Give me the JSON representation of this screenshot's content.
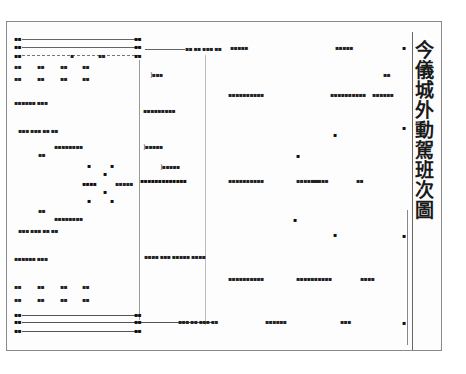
{
  "document": {
    "title": "今儀城外動駕班次圖",
    "title_chars": [
      "今",
      "儀",
      "城",
      "外",
      "動",
      "駕",
      "班",
      "次",
      "圖"
    ],
    "illegible_note": "Small annotations are rotated classical characters, illegible at this resolution"
  },
  "marks": {
    "left_top_rows": [
      {
        "left": "▪▪",
        "right": "▪▪"
      },
      {
        "left": "▪▪",
        "right": "▪▪"
      },
      {
        "left": "▪▪",
        "mid1": "▪",
        "mid2": "▪▪",
        "right": "▪▪"
      }
    ],
    "left_top_grid": [
      [
        "▪▪",
        "▪▪",
        "▪▪",
        "▪▪"
      ],
      [
        "▪▪",
        "▪▪",
        "▪▪",
        "▪▪"
      ]
    ],
    "left_groups": [
      "▪▪▪▪▪▪ ▪▪▪",
      "▪▪▪ ▪▪▪ ▪▪ ▪▪",
      "▪▪▪▪▪▪▪▪",
      "▪▪",
      "▪▪▪▪▪",
      "▪▪▪▪▪",
      "▪▪",
      "▪▪▪▪▪▪▪▪",
      "▪▪▪ ▪▪▪ ▪▪ ▪▪",
      "▪▪▪▪▪▪ ▪▪▪"
    ],
    "formation": [
      "▪",
      "▪",
      "▪",
      "▪▪▪▪",
      "▪",
      "▪",
      "▪"
    ],
    "left_bottom_grid": [
      [
        "▪▪",
        "▪▪",
        "▪▪",
        "▪▪"
      ],
      [
        "▪▪",
        "▪▪",
        "▪▪",
        "▪▪"
      ]
    ],
    "center_labels": [
      "]▪▪▪",
      "▪▪▪▪▪▪▪▪▪",
      "]▪▪▪▪▪",
      "]▪▪▪▪▪",
      "▪▪▪▪▪▪▪▪▪▪▪▪▪",
      "▪▪▪▪ ▪▪▪ ▪▪▪▪▪ ▪▪▪▪"
    ],
    "center_top_row": "▪▪ ▪▪ ▪▪▪ ▪▪",
    "center_bottom_row": "▪▪▪ ▪▪ ▪▪▪ ▪▪",
    "right_labels": [
      "▪▪▪▪▪",
      "▪▪▪▪▪",
      "▪▪▪▪▪▪▪▪▪▪",
      "▪▪▪▪▪▪▪▪▪▪",
      "▪▪▪▪▪▪",
      "▪▪▪▪▪▪",
      "▪▪▪▪▪▪▪▪▪▪",
      "▪▪▪▪▪▪▪▪▪",
      "▪▪▪▪",
      "▪▪▪"
    ],
    "scatter": [
      "▪",
      "▪",
      "▪",
      "▪",
      "▪",
      "▪▪",
      "▪▪",
      "▪▪",
      "▪▪▪"
    ]
  }
}
